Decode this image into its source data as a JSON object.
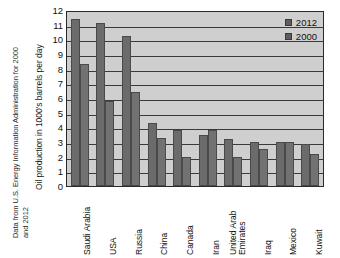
{
  "source_note": {
    "line1": "Data from U.S. Energy Information Administration for 2000",
    "line2": "and 2012"
  },
  "chart_data": {
    "type": "bar",
    "title": "",
    "xlabel": "",
    "ylabel": "Oil production in 1000's barrels per day",
    "ylim": [
      0,
      12
    ],
    "ytick_labels": [
      "12",
      "11",
      "10",
      "9",
      "8",
      "7",
      "6",
      "5",
      "4",
      "3",
      "2",
      "1",
      "0"
    ],
    "ytick_values": [
      12,
      11,
      10,
      9,
      8,
      7,
      6,
      5,
      4,
      3,
      2,
      1,
      0
    ],
    "grid": true,
    "legend_position": "top-right",
    "categories": [
      "Saudi Arabia",
      "USA",
      "Russia",
      "China",
      "Canada",
      "Iran",
      "United Arab Emirates",
      "Iraq",
      "Mexico",
      "Kuwait"
    ],
    "category_lines": [
      [
        "Saudi Arabia"
      ],
      [
        "USA"
      ],
      [
        "Russia"
      ],
      [
        "China"
      ],
      [
        "Canada"
      ],
      [
        "Iran"
      ],
      [
        "United Arab",
        "Emirates"
      ],
      [
        "Iraq"
      ],
      [
        "Mexico"
      ],
      [
        "Kuwait"
      ]
    ],
    "series": [
      {
        "name": "2012",
        "color": "#6b6b6b",
        "values": [
          11.4,
          11.1,
          10.25,
          4.3,
          3.8,
          3.5,
          3.2,
          3.0,
          3.0,
          2.85
        ]
      },
      {
        "name": "2000",
        "color": "#727272",
        "values": [
          8.3,
          5.8,
          6.4,
          3.25,
          2.0,
          3.8,
          2.0,
          2.55,
          3.0,
          2.15
        ]
      }
    ]
  },
  "legend": {
    "items": [
      {
        "label": "2012",
        "color": "#5e5e5e"
      },
      {
        "label": "2000",
        "color": "#5e5e5e"
      }
    ]
  },
  "colors": {
    "plot_background": "#cfcfcf",
    "gridline": "#3a3a3a",
    "axis": "#2a2a2a",
    "bar_2012": "#6b6b6b",
    "bar_2000": "#727272",
    "page_background": "#ffffff"
  }
}
